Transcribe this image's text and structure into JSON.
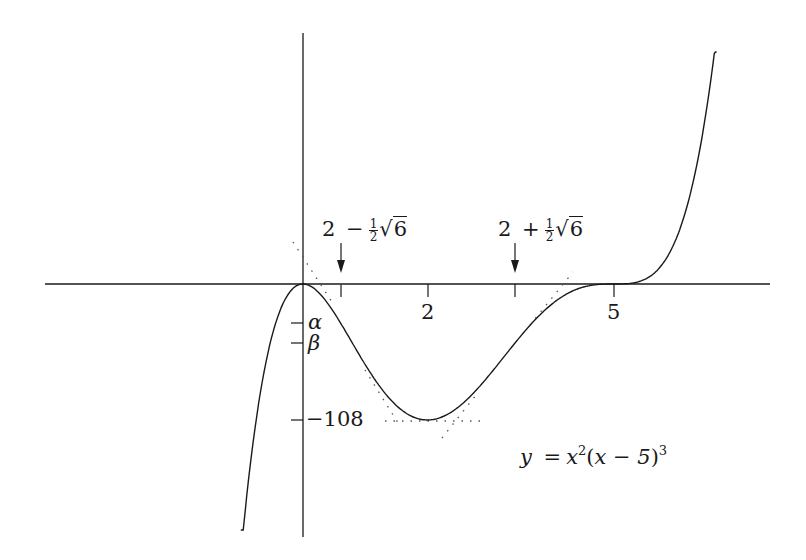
{
  "figure": {
    "equation": {
      "lhs": "y",
      "eq": "=",
      "x": "x",
      "exp2": "2",
      "paren_open": "(",
      "inner": "x − 5",
      "paren_close": ")",
      "exp3": "3"
    },
    "x_ticks": [
      {
        "label": "2",
        "x_value": 2
      },
      {
        "label": "5",
        "x_value": 5
      }
    ],
    "arrow_labels": [
      {
        "id": "left",
        "whole": "2",
        "op": "−",
        "frac_num": "1",
        "frac_den": "2",
        "sqrt_arg": "6",
        "approx_x": 0.6
      },
      {
        "id": "right",
        "whole": "2",
        "op": "+",
        "frac_num": "1",
        "frac_den": "2",
        "sqrt_arg": "6",
        "approx_x": 3.4
      }
    ],
    "y_ticks": [
      {
        "label": "α",
        "italic": true
      },
      {
        "label": "β",
        "italic": true
      },
      {
        "label": "−108",
        "y_value": -108
      }
    ],
    "colors": {
      "ink": "#1a1a1a",
      "background": "#ffffff"
    }
  },
  "chart_data": {
    "type": "line",
    "title": "",
    "function": "y = x^2 (x - 5)^3",
    "xlabel": "",
    "ylabel": "",
    "x_range_drawn": [
      -1.0,
      6.65
    ],
    "grid": false,
    "key_points": [
      {
        "name": "local max (double root)",
        "x": 0,
        "y": 0
      },
      {
        "name": "local min",
        "x": 2,
        "y": -108
      },
      {
        "name": "inflection (triple root)",
        "x": 5,
        "y": 0
      },
      {
        "name": "inflection",
        "x": "2 − ½√6",
        "y": "α"
      },
      {
        "name": "inflection",
        "x": "2 + ½√6",
        "y": "β"
      }
    ],
    "x_tick_labels": [
      "2 − ½√6",
      "2",
      "2 + ½√6",
      "5"
    ],
    "y_tick_labels": [
      "α",
      "β",
      "−108"
    ],
    "annotations": [
      "dotted tangent lines at stationary and inflection points",
      "arrows marking 2 − ½√6 and 2 + ½√6"
    ]
  }
}
